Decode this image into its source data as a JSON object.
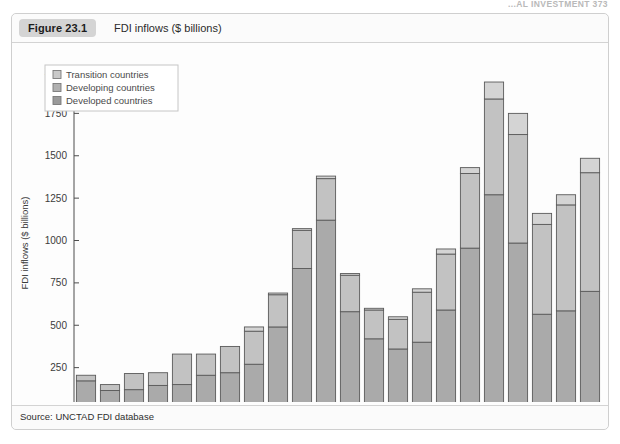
{
  "page_header": "...AL INVESTMENT  373",
  "figure": {
    "badge": "Figure 23.1",
    "title": "FDI inflows ($ billions)",
    "source": "Source: UNCTAD FDI database"
  },
  "legend": {
    "position": "top-left-inside",
    "items": [
      {
        "label": "Transition countries",
        "color": "#c9c9c9"
      },
      {
        "label": "Developing countries",
        "color": "#b0b0b0"
      },
      {
        "label": "Developed countries",
        "color": "#9a9a9a"
      }
    ]
  },
  "chart_data": {
    "type": "bar",
    "stacked": true,
    "title": "FDI inflows ($ billions)",
    "xlabel": "",
    "ylabel": "FDI inflows ($ billions)",
    "ylim": [
      0,
      2000
    ],
    "yticks": [
      0,
      250,
      500,
      750,
      1000,
      1250,
      1500,
      1750,
      2000
    ],
    "ytick_labels": [
      "0",
      "250",
      "500",
      "750",
      "1000",
      "1250",
      "1500",
      "1750",
      "2000"
    ],
    "grid": false,
    "categories": [
      "1990",
      "1991",
      "1992",
      "1993",
      "1994",
      "1995",
      "1996",
      "1997",
      "1998",
      "1999",
      "2000",
      "2001",
      "2002",
      "2003",
      "2004",
      "2005",
      "2006",
      "2007",
      "2008",
      "2009",
      "2010",
      "2011"
    ],
    "xtick_labels": [
      "1990",
      "1992",
      "1994",
      "1996",
      "1998",
      "2000",
      "2002",
      "2004",
      "2006",
      "2008",
      "2010"
    ],
    "series": [
      {
        "name": "Developed countries",
        "color": "#aaaaaa",
        "values": [
          172,
          115,
          120,
          145,
          150,
          205,
          220,
          270,
          490,
          835,
          1120,
          580,
          420,
          360,
          400,
          590,
          955,
          1270,
          985,
          565,
          585,
          700
        ]
      },
      {
        "name": "Developing countries",
        "color": "#c2c2c2",
        "values": [
          33,
          35,
          95,
          75,
          180,
          125,
          155,
          195,
          190,
          225,
          245,
          215,
          170,
          175,
          295,
          330,
          440,
          565,
          640,
          530,
          625,
          700
        ]
      },
      {
        "name": "Transition countries",
        "color": "#d4d4d4",
        "values": [
          0,
          0,
          0,
          0,
          0,
          0,
          0,
          25,
          10,
          10,
          15,
          10,
          10,
          15,
          20,
          30,
          35,
          100,
          125,
          65,
          60,
          85
        ]
      }
    ],
    "totals": [
      205,
      150,
      215,
      220,
      330,
      330,
      375,
      490,
      690,
      1070,
      1380,
      805,
      600,
      550,
      715,
      950,
      1430,
      1935,
      1750,
      1160,
      1270,
      1485
    ]
  }
}
